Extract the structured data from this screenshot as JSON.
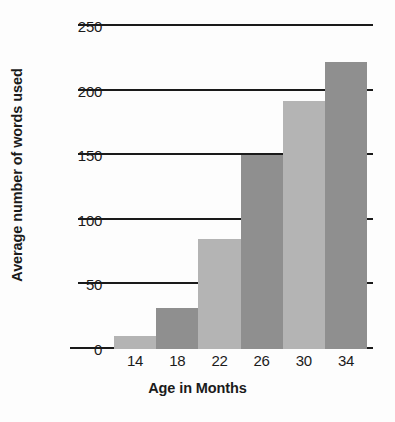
{
  "chart_data": {
    "type": "bar",
    "title": "",
    "xlabel": "Age in Months",
    "ylabel": "Average number of words used",
    "categories": [
      "14",
      "18",
      "22",
      "26",
      "30",
      "34"
    ],
    "values": [
      10,
      32,
      85,
      150,
      192,
      222
    ],
    "ylim": [
      0,
      250
    ],
    "yticks": [
      0,
      50,
      100,
      150,
      200,
      250
    ],
    "ytick_labels": [
      "0",
      "50",
      "100",
      "150",
      "200",
      "250"
    ],
    "grid": true,
    "legend": false,
    "bar_colors": [
      "#b4b4b4",
      "#8f8f8f",
      "#b4b4b4",
      "#8f8f8f",
      "#b4b4b4",
      "#8f8f8f"
    ],
    "gridline_color": "#1a1a1a",
    "text_color": "#1b1b1b",
    "background_color": "#fdfdfd"
  }
}
